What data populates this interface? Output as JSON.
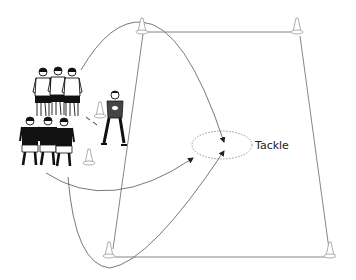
{
  "diagram": {
    "type": "rugby drill diagram",
    "zone_label": "Tackle",
    "colors": {
      "line": "#555555",
      "dashed_circle": "#888888",
      "text": "#222222",
      "cone_outline": "#999999",
      "dark_jersey": "#111111",
      "light_jersey": "#ffffff"
    },
    "elements": {
      "cones": [
        "top-left",
        "top-right",
        "bottom-left",
        "bottom-right",
        "start-cone-upper",
        "start-cone-lower"
      ],
      "players": {
        "white_jersey_group": 3,
        "black_jersey_group": 3,
        "coach_with_ball": 1
      },
      "paths": [
        "arc-over-top-cone-to-tackle",
        "curve-to-tackle-from-black-group",
        "loop-under-bottom-cone-to-tackle"
      ]
    }
  }
}
